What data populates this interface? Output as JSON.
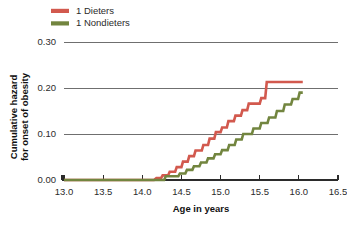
{
  "chart_data": {
    "type": "line",
    "subtype": "step",
    "title": "",
    "xlabel": "Age in years",
    "ylabel": "Cumulative hazard for onset of obesity",
    "ylabel_lines": [
      "Cumulative hazard",
      "for onset of obesity"
    ],
    "xlim": [
      13.0,
      16.5
    ],
    "ylim": [
      0.0,
      0.3
    ],
    "xticks": [
      13.0,
      13.5,
      14.0,
      14.5,
      15.0,
      15.5,
      16.0,
      16.5
    ],
    "xtick_labels": [
      "13.0",
      "13.5",
      "14.0",
      "14.5",
      "15.0",
      "15.5",
      "16.0",
      "16.5"
    ],
    "yticks": [
      0.0,
      0.1,
      0.2,
      0.3
    ],
    "ytick_labels": [
      "0.00",
      "0.10",
      "0.20",
      "0.30"
    ],
    "grid": "horizontal",
    "legend_position": "top-left",
    "series": [
      {
        "name": "1 Dieters",
        "color": "#d2594e",
        "points": [
          [
            13.0,
            0.0
          ],
          [
            14.15,
            0.0
          ],
          [
            14.18,
            0.004
          ],
          [
            14.24,
            0.004
          ],
          [
            14.26,
            0.01
          ],
          [
            14.33,
            0.01
          ],
          [
            14.35,
            0.018
          ],
          [
            14.42,
            0.018
          ],
          [
            14.44,
            0.028
          ],
          [
            14.5,
            0.028
          ],
          [
            14.52,
            0.04
          ],
          [
            14.58,
            0.04
          ],
          [
            14.6,
            0.052
          ],
          [
            14.66,
            0.052
          ],
          [
            14.68,
            0.064
          ],
          [
            14.76,
            0.064
          ],
          [
            14.78,
            0.076
          ],
          [
            14.84,
            0.076
          ],
          [
            14.86,
            0.09
          ],
          [
            14.92,
            0.09
          ],
          [
            14.94,
            0.104
          ],
          [
            15.0,
            0.104
          ],
          [
            15.02,
            0.114
          ],
          [
            15.08,
            0.114
          ],
          [
            15.1,
            0.128
          ],
          [
            15.17,
            0.128
          ],
          [
            15.19,
            0.14
          ],
          [
            15.26,
            0.14
          ],
          [
            15.28,
            0.152
          ],
          [
            15.34,
            0.152
          ],
          [
            15.36,
            0.166
          ],
          [
            15.5,
            0.166
          ],
          [
            15.52,
            0.178
          ],
          [
            15.57,
            0.178
          ],
          [
            15.59,
            0.213
          ],
          [
            16.05,
            0.213
          ]
        ]
      },
      {
        "name": "1 Nondieters",
        "color": "#72853f",
        "points": [
          [
            13.0,
            0.0
          ],
          [
            14.28,
            0.0
          ],
          [
            14.3,
            0.008
          ],
          [
            14.46,
            0.008
          ],
          [
            14.48,
            0.014
          ],
          [
            14.55,
            0.014
          ],
          [
            14.57,
            0.022
          ],
          [
            14.64,
            0.022
          ],
          [
            14.66,
            0.03
          ],
          [
            14.73,
            0.03
          ],
          [
            14.75,
            0.038
          ],
          [
            14.82,
            0.038
          ],
          [
            14.84,
            0.047
          ],
          [
            14.91,
            0.047
          ],
          [
            14.93,
            0.056
          ],
          [
            15.0,
            0.056
          ],
          [
            15.02,
            0.065
          ],
          [
            15.09,
            0.065
          ],
          [
            15.11,
            0.076
          ],
          [
            15.18,
            0.076
          ],
          [
            15.2,
            0.088
          ],
          [
            15.27,
            0.088
          ],
          [
            15.29,
            0.1
          ],
          [
            15.4,
            0.1
          ],
          [
            15.42,
            0.112
          ],
          [
            15.5,
            0.112
          ],
          [
            15.52,
            0.124
          ],
          [
            15.6,
            0.124
          ],
          [
            15.62,
            0.136
          ],
          [
            15.7,
            0.136
          ],
          [
            15.72,
            0.15
          ],
          [
            15.8,
            0.15
          ],
          [
            15.82,
            0.164
          ],
          [
            15.9,
            0.164
          ],
          [
            15.92,
            0.176
          ],
          [
            15.99,
            0.176
          ],
          [
            16.01,
            0.19
          ],
          [
            16.05,
            0.19
          ]
        ]
      }
    ]
  },
  "legend": {
    "items": [
      {
        "label": "1 Dieters",
        "color": "#d2594e"
      },
      {
        "label": "1 Nondieters",
        "color": "#72853f"
      }
    ]
  },
  "colors": {
    "dieters": "#d2594e",
    "nondieters": "#72853f",
    "grid": "#6f6f6f",
    "axis": "#2b2b2b",
    "background": "#ffffff"
  }
}
